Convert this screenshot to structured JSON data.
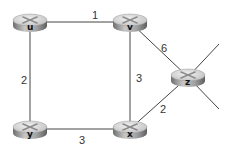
{
  "diagram": {
    "type": "network-graph",
    "nodes": [
      {
        "id": "u",
        "label": "u",
        "x": 30,
        "y": 22
      },
      {
        "id": "v",
        "label": "v",
        "x": 130,
        "y": 22
      },
      {
        "id": "y",
        "label": "y",
        "x": 30,
        "y": 129
      },
      {
        "id": "x",
        "label": "x",
        "x": 130,
        "y": 129
      },
      {
        "id": "z",
        "label": "z",
        "x": 188,
        "y": 77
      }
    ],
    "edges": [
      {
        "from": "u",
        "to": "v",
        "weight": "1"
      },
      {
        "from": "u",
        "to": "y",
        "weight": "2"
      },
      {
        "from": "v",
        "to": "x",
        "weight": "3"
      },
      {
        "from": "v",
        "to": "z",
        "weight": "6"
      },
      {
        "from": "y",
        "to": "x",
        "weight": "3"
      },
      {
        "from": "x",
        "to": "z",
        "weight": "2"
      }
    ],
    "external_links": [
      {
        "from": "z",
        "direction": "upper-right"
      },
      {
        "from": "z",
        "direction": "lower-right"
      }
    ],
    "colors": {
      "line": "#444444",
      "router_top": "#d9d9d9",
      "router_side": "#8f8f8f",
      "router_mark": "#9a9a9a"
    }
  }
}
